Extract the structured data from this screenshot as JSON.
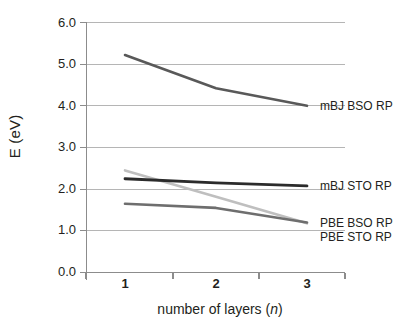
{
  "chart_data": {
    "type": "line",
    "title": "",
    "xlabel": "number of layers (n)",
    "xlabel_plain": "number of layers (",
    "xlabel_italic": "n",
    "xlabel_tail": ")",
    "ylabel": "E (eV)",
    "categories": [
      "1",
      "2",
      "3"
    ],
    "x": [
      1,
      2,
      3
    ],
    "xlim": [
      0.5,
      3.5
    ],
    "ylim": [
      0.0,
      6.0
    ],
    "ytick_labels": [
      "6.0",
      "5.0",
      "4.0",
      "3.0",
      "2.0",
      "1.0",
      "0.0"
    ],
    "ytick_values": [
      6.0,
      5.0,
      4.0,
      3.0,
      2.0,
      1.0,
      0.0
    ],
    "grid": "horizontal",
    "legend_position": "right-inline-labels",
    "series": [
      {
        "name": "mBJ BSO RP",
        "values": [
          5.22,
          4.42,
          4.0
        ],
        "color": "#595959"
      },
      {
        "name": "mBJ STO RP",
        "values": [
          2.25,
          2.15,
          2.08
        ],
        "color": "#2b2b2b"
      },
      {
        "name": "PBE BSO RP",
        "values": [
          1.65,
          1.55,
          1.2
        ],
        "color": "#6e6e6e"
      },
      {
        "name": "PBE STO RP",
        "values": [
          2.45,
          1.82,
          1.18
        ],
        "color": "#bfbfbf"
      }
    ]
  },
  "axes": {
    "y_label": "E (eV)",
    "y_ticks": {
      "t0": "6.0",
      "t1": "5.0",
      "t2": "4.0",
      "t3": "3.0",
      "t4": "2.0",
      "t5": "1.0",
      "t6": "0.0"
    },
    "x_ticks": {
      "t0": "1",
      "t1": "2",
      "t2": "3"
    },
    "x_label_pre": "number of layers (",
    "x_label_var": "n",
    "x_label_post": ")"
  },
  "labels": {
    "mbj_bso": "mBJ BSO RP",
    "mbj_sto": "mBJ STO RP",
    "pbe_bso": "PBE BSO RP",
    "pbe_sto": "PBE STO RP"
  },
  "colors": {
    "grid": "#b3b3b3",
    "axis": "#8c8c8c",
    "text": "#231f20",
    "mbj_bso": "#595959",
    "mbj_sto": "#2b2b2b",
    "pbe_bso": "#6e6e6e",
    "pbe_sto": "#bfbfbf",
    "background": "#ffffff"
  }
}
